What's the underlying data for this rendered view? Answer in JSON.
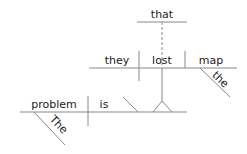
{
  "diagram": {
    "type": "sentence-diagram",
    "sentence": "The problem is that they lost the map",
    "main_clause": {
      "subject": "problem",
      "subject_modifier": "The",
      "verb": "is"
    },
    "noun_clause": {
      "connector": "that",
      "subject": "they",
      "verb": "lost",
      "object": "map",
      "object_modifier": "the"
    },
    "colors": {
      "line": "#888888",
      "text": "#222222"
    }
  }
}
